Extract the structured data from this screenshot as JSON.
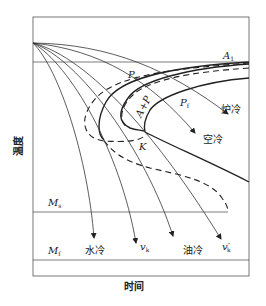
{
  "diagram": {
    "type": "CCT cooling curves on C-curve (TTT) diagram",
    "axes": {
      "x_label": "时间",
      "y_label": "温度"
    },
    "levels": {
      "A1": {
        "main": "A",
        "sub": "1"
      },
      "Ms": {
        "main": "M",
        "sub": "s"
      },
      "Mf": {
        "main": "M",
        "sub": "f"
      }
    },
    "region_labels": {
      "Ps": {
        "main": "P",
        "sub": "s"
      },
      "Pf": {
        "main": "P",
        "sub": "f"
      },
      "AP": "A+P",
      "K": "K"
    },
    "cooling_curves": [
      {
        "id": "furnace",
        "label": "炉冷"
      },
      {
        "id": "air",
        "label": "空冷"
      },
      {
        "id": "vk_prime",
        "label": "v",
        "sub": "k",
        "prime": "′"
      },
      {
        "id": "oil",
        "label": "油冷"
      },
      {
        "id": "vk",
        "label": "v",
        "sub": "k"
      },
      {
        "id": "water",
        "label": "水冷"
      }
    ]
  }
}
